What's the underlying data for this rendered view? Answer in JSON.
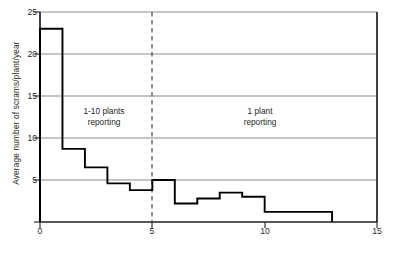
{
  "chart_data": {
    "type": "line",
    "title": "",
    "subtitle": "",
    "xlabel": "Years since licensing",
    "ylabel": "Average number of scrams/plant/year",
    "xlim": [
      0,
      15
    ],
    "ylim": [
      0,
      25
    ],
    "xticks": [
      0,
      5,
      10,
      15
    ],
    "yticks": [
      0,
      5,
      10,
      15,
      20,
      25
    ],
    "xtick_labels": [
      "0",
      "5",
      "10",
      "15"
    ],
    "ytick_labels": [
      "0",
      "5",
      "10",
      "15",
      "20",
      "25"
    ],
    "grid": "horizontal gridlines at every y tick",
    "legend": "none",
    "drawstyle": "steps-post",
    "series": [
      {
        "name": "Average number of scrams per plant per year",
        "x_intervals": [
          [
            0,
            1
          ],
          [
            1,
            2
          ],
          [
            2,
            3
          ],
          [
            3,
            4
          ],
          [
            4,
            5
          ],
          [
            5,
            6
          ],
          [
            6,
            7
          ],
          [
            7,
            8
          ],
          [
            8,
            9
          ],
          [
            9,
            10
          ],
          [
            10,
            13
          ]
        ],
        "values": [
          23.0,
          8.7,
          6.5,
          4.6,
          3.8,
          5.0,
          2.2,
          2.8,
          3.5,
          3.0,
          1.2
        ]
      }
    ],
    "annotations": [
      {
        "name": "left-region-note",
        "text": "1-10 plants\nreporting",
        "x_range": [
          1,
          5
        ],
        "at_x": 3.0,
        "at_y": 12.5
      },
      {
        "name": "right-region-note",
        "text": "1 plant\nreporting",
        "x_range": [
          5,
          15
        ],
        "at_x": 9.7,
        "at_y": 12.5
      }
    ],
    "reference_lines": [
      {
        "name": "reporting-boundary",
        "orientation": "vertical",
        "x": 5,
        "style": "dashed"
      }
    ]
  }
}
